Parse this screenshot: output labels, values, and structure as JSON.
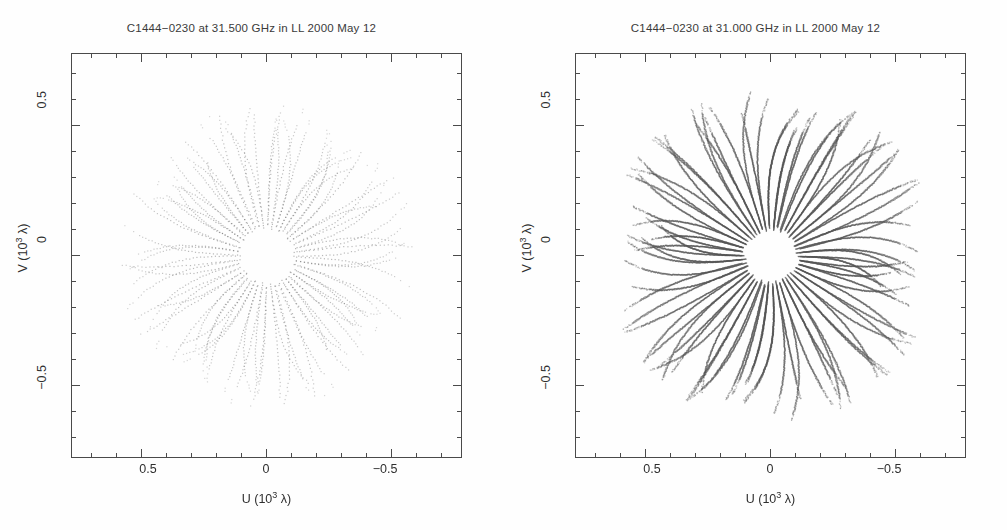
{
  "figure": {
    "width": 1007,
    "height": 530,
    "background": "#ffffff",
    "ink_color": "#4a4a4a",
    "point_color": "#555555"
  },
  "panels": [
    {
      "id": "left",
      "title": "C1444−0230 at 31.500 GHz in LL  2000 May 12",
      "source": "C1444−0230",
      "frequency": "31.500 GHz",
      "polarization": "LL",
      "date": "2000 May 12",
      "xlabel_prefix": "U (10",
      "xlabel_exp": "3",
      "xlabel_suffix": " λ)",
      "ylabel_prefix": "V (10",
      "ylabel_exp": "3",
      "ylabel_suffix": " λ)",
      "xticks": [
        "0.5",
        "0",
        "−0.5"
      ],
      "yticks": [
        "0.5",
        "0",
        "−0.5"
      ]
    },
    {
      "id": "right",
      "title": "C1444−0230 at 31.000 GHz in LL  2000 May 12",
      "source": "C1444−0230",
      "frequency": "31.000 GHz",
      "polarization": "LL",
      "date": "2000 May 12",
      "xlabel_prefix": "U (10",
      "xlabel_exp": "3",
      "xlabel_suffix": " λ)",
      "ylabel_prefix": "V (10",
      "ylabel_exp": "3",
      "ylabel_suffix": " λ)",
      "xticks": [
        "0.5",
        "0",
        "−0.5"
      ],
      "yticks": [
        "0.5",
        "0",
        "−0.5"
      ]
    }
  ],
  "chart_data": {
    "type": "scatter",
    "xlabel": "U (10^3 lambda)",
    "ylabel": "V (10^3 lambda)",
    "xlim": [
      0.78,
      -0.78
    ],
    "ylim": [
      -0.78,
      0.78
    ],
    "x_axis_reversed": true,
    "major_tick_values": [
      0.5,
      0.0,
      -0.5
    ],
    "major_tick_labels": [
      "0.5",
      "0",
      "−0.5"
    ],
    "minor_tick_step": 0.1,
    "grid": false,
    "legend": null,
    "marker": "dot",
    "marker_size_px": 1.2,
    "panels": [
      {
        "name": "31.500 GHz LL",
        "title": "C1444−0230 at 31.500 GHz in LL  2000 May 12",
        "n_points_approx": 1500,
        "n_spokes": 44,
        "samples_per_spoke": 34,
        "inner_radius": 0.115,
        "outer_radius": 0.56,
        "radial_density": "sparse",
        "dot_opacity": 0.42,
        "description": "Sparse snapshot UV coverage: dotted elliptical arcs radiating from a central hole; points thin out beyond r=0.5."
      },
      {
        "name": "31.000 GHz LL",
        "title": "C1444−0230 at 31.000 GHz in LL  2000 May 12",
        "n_points_approx": 38000,
        "n_spokes": 46,
        "samples_per_spoke": 420,
        "inner_radius": 0.105,
        "outer_radius": 0.62,
        "radial_density": "dense",
        "dot_opacity": 0.55,
        "description": "Dense full-track UV coverage: starburst of ~46 radial spokes of closely spaced dots around a clear central hole, outer envelope near r=0.6."
      }
    ]
  }
}
